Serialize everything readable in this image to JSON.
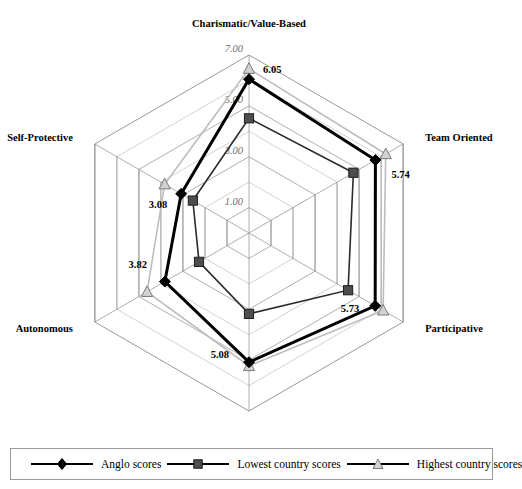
{
  "chart_data": {
    "type": "radar",
    "title": "",
    "categories": [
      "Charismatic/Value-Based",
      "Team Oriented",
      "Participative",
      "Humane Oriented",
      "Autonomous",
      "Self-Protective"
    ],
    "rings": [
      "1.00",
      "3.00",
      "5.00",
      "7.00"
    ],
    "ring_values": [
      1,
      3,
      5,
      7
    ],
    "rlim": [
      0,
      7
    ],
    "grid": true,
    "legend_position": "bottom",
    "series": [
      {
        "name": "Anglo scores",
        "marker": "diamond",
        "color": "#000000",
        "values": [
          6.05,
          5.74,
          5.73,
          5.08,
          3.82,
          3.08
        ],
        "labels": [
          "6.05",
          "5.74",
          "5.73",
          "5.08",
          "3.82",
          "3.08"
        ]
      },
      {
        "name": "Lowest country scores",
        "marker": "square",
        "color": "#4d4d4d",
        "values": [
          4.51,
          4.74,
          4.5,
          3.18,
          2.27,
          2.55
        ],
        "labels": [
          "",
          "",
          "",
          "",
          "",
          ""
        ]
      },
      {
        "name": "Highest country scores",
        "marker": "triangle",
        "color": "#c8c8c8",
        "values": [
          6.46,
          6.21,
          6.09,
          5.23,
          4.63,
          3.83
        ],
        "labels": [
          "",
          "",
          "",
          "",
          "",
          ""
        ]
      }
    ]
  },
  "legend": {
    "items": [
      {
        "label": "Anglo scores",
        "marker": "diamond"
      },
      {
        "label": "Lowest country scores",
        "marker": "square"
      },
      {
        "label": "Highest country scores",
        "marker": "triangle"
      }
    ]
  }
}
